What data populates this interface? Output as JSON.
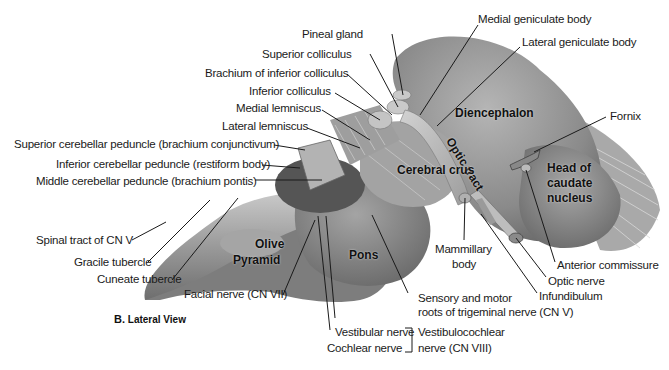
{
  "figure": {
    "caption_letter": "B.",
    "caption_text": "Lateral View"
  },
  "structures_inner": {
    "diencephalon": "Diencephalon",
    "optic_tract": "Optic tract",
    "cerebral_crus": "Cerebral crus",
    "head_of_caudate_1": "Head of",
    "head_of_caudate_2": "caudate",
    "head_of_caudate_3": "nucleus",
    "olive": "Olive",
    "pyramid": "Pyramid",
    "pons": "Pons"
  },
  "labels": {
    "pineal_gland": "Pineal gland",
    "superior_colliculus": "Superior colliculus",
    "brachium_inferior_colliculus": "Brachium of inferior colliculus",
    "inferior_colliculus": "Inferior colliculus",
    "medial_lemniscus": "Medial lemniscus",
    "lateral_lemniscus": "Lateral lemniscus",
    "superior_cerebellar_peduncle": "Superior cerebellar peduncle (brachium conjunctivum)",
    "inferior_cerebellar_peduncle": "Inferior cerebellar peduncle (restiform body)",
    "middle_cerebellar_peduncle": "Middle cerebellar peduncle (brachium pontis)",
    "medial_geniculate_body": "Medial geniculate body",
    "lateral_geniculate_body": "Lateral geniculate body",
    "fornix": "Fornix",
    "spinal_tract_cn_v": "Spinal tract of CN V",
    "gracile_tubercle": "Gracile tubercle",
    "cuneate_tubercle": "Cuneate tubercle",
    "facial_nerve": "Facial nerve (CN VII)",
    "vestibular_nerve": "Vestibular nerve",
    "cochlear_nerve": "Cochlear nerve",
    "vestibulocochlear_1": "Vestibulocochlear",
    "vestibulocochlear_2": "nerve (CN VIII)",
    "trigeminal_1": "Sensory and motor",
    "trigeminal_2": "roots of trigeminal nerve (CN V)",
    "mammillary_1": "Mammillary",
    "mammillary_2": "body",
    "infundibulum": "Infundibulum",
    "optic_nerve": "Optic nerve",
    "anterior_commissure": "Anterior commissure"
  },
  "colors": {
    "background": "#ffffff",
    "tissue_light": "#b8b8b8",
    "tissue_mid": "#8f8f8f",
    "tissue_dark": "#5e5e5e",
    "leader_line": "#1a1a1a"
  }
}
